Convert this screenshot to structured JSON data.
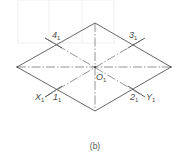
{
  "diagram": {
    "caption": "(b)",
    "colors": {
      "stroke": "#555555",
      "centerline": "#666666",
      "ghost": "#eeeeee"
    },
    "center": {
      "name": "O",
      "sub": "1",
      "x": 95,
      "y": 67
    },
    "rhombus": {
      "top": [
        95,
        23
      ],
      "right": [
        171,
        67
      ],
      "bottom": [
        95,
        111
      ],
      "left": [
        17,
        67
      ]
    },
    "points": [
      {
        "name": "4",
        "sub": "1",
        "x": 56,
        "y": 44,
        "label_x": 52,
        "label_y": 40
      },
      {
        "name": "3",
        "sub": "1",
        "x": 133,
        "y": 44,
        "label_x": 128,
        "label_y": 40
      },
      {
        "name": "1",
        "sub": "1",
        "x": 56,
        "y": 89,
        "label_x": 52,
        "label_y": 102
      },
      {
        "name": "2",
        "sub": "1",
        "x": 133,
        "y": 89,
        "label_x": 130,
        "label_y": 102
      }
    ],
    "axes": [
      {
        "name": "X",
        "sub": "1",
        "label_x": 35,
        "label_y": 102
      },
      {
        "name": "Y",
        "sub": "1",
        "label_x": 146,
        "label_y": 102
      }
    ],
    "labels": {
      "center": "O",
      "center_sub": "1",
      "p4": "4",
      "p3": "3",
      "p1": "1",
      "p2": "2",
      "x_axis": "X",
      "y_axis": "Y",
      "sub": "1"
    }
  }
}
